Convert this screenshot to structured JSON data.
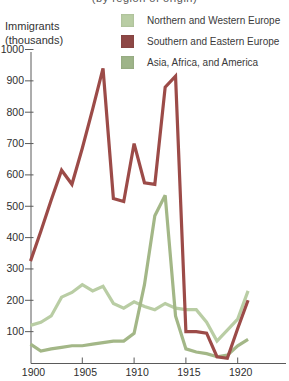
{
  "page": {
    "clipped_title": "(by region of origin)"
  },
  "y_axis": {
    "label_line1": "Immigrants",
    "label_line2": "(thousands)",
    "ticks": [
      100,
      200,
      300,
      400,
      500,
      600,
      700,
      800,
      900,
      1000
    ]
  },
  "x_axis": {
    "ticks": [
      1900,
      1905,
      1910,
      1915,
      1920
    ]
  },
  "legend": {
    "items": [
      {
        "label": "Northern and Western Europe",
        "color": "#b9cda4"
      },
      {
        "label": "Southern and Eastern Europe",
        "color": "#8e4846"
      },
      {
        "label": "Asia, Africa, and America",
        "color": "#9eb489"
      }
    ]
  },
  "colors": {
    "axis": "#5a5a5a",
    "tick_text": "#2e2e2e"
  },
  "chart_data": {
    "type": "line",
    "title": "",
    "xlabel": "",
    "ylabel": "Immigrants (thousands)",
    "ylim": [
      0,
      1050
    ],
    "xlim": [
      1900,
      1924
    ],
    "grid": false,
    "legend_position": "top-right",
    "x": [
      1900,
      1901,
      1902,
      1903,
      1904,
      1905,
      1906,
      1907,
      1908,
      1909,
      1910,
      1911,
      1912,
      1913,
      1914,
      1915,
      1916,
      1917,
      1918,
      1919,
      1920,
      1921
    ],
    "series": [
      {
        "name": "Northern and Western Europe",
        "color": "#b9cda4",
        "values": [
          120,
          130,
          150,
          210,
          225,
          250,
          230,
          245,
          190,
          175,
          195,
          180,
          170,
          190,
          175,
          170,
          170,
          130,
          70,
          105,
          140,
          230
        ]
      },
      {
        "name": "Southern and Eastern Europe",
        "color": "#9c4b48",
        "values": [
          325,
          420,
          520,
          615,
          570,
          685,
          810,
          940,
          525,
          515,
          700,
          575,
          570,
          880,
          915,
          100,
          100,
          95,
          20,
          15,
          110,
          200
        ]
      },
      {
        "name": "Asia, Africa, and America",
        "color": "#a3b787",
        "values": [
          60,
          38,
          45,
          50,
          55,
          55,
          60,
          65,
          70,
          70,
          95,
          250,
          470,
          535,
          150,
          45,
          35,
          30,
          20,
          25,
          55,
          75
        ]
      }
    ]
  }
}
